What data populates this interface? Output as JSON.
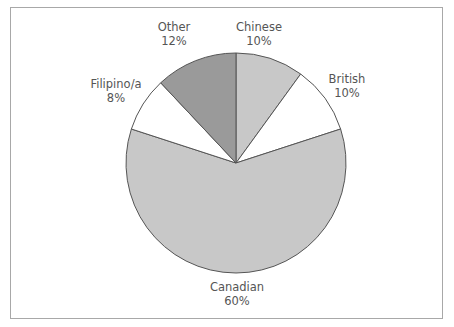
{
  "chart_data": {
    "type": "pie",
    "title": "",
    "start_angle_deg": 0,
    "direction": "clockwise",
    "categories": [
      "Chinese",
      "British",
      "Canadian",
      "Filipino/a",
      "Other"
    ],
    "values": [
      10,
      10,
      60,
      8,
      12
    ],
    "value_labels": [
      "10%",
      "10%",
      "60%",
      "8%",
      "12%"
    ],
    "colors": [
      "#c8c8c8",
      "#ffffff",
      "#c8c8c8",
      "#ffffff",
      "#9a9a9a"
    ],
    "legend": "none",
    "outline_color": "#555555"
  },
  "labels": [
    {
      "name": "Chinese",
      "pct": "10%"
    },
    {
      "name": "British",
      "pct": "10%"
    },
    {
      "name": "Canadian",
      "pct": "60%"
    },
    {
      "name": "Filipino/a",
      "pct": "8%"
    },
    {
      "name": "Other",
      "pct": "12%"
    }
  ]
}
